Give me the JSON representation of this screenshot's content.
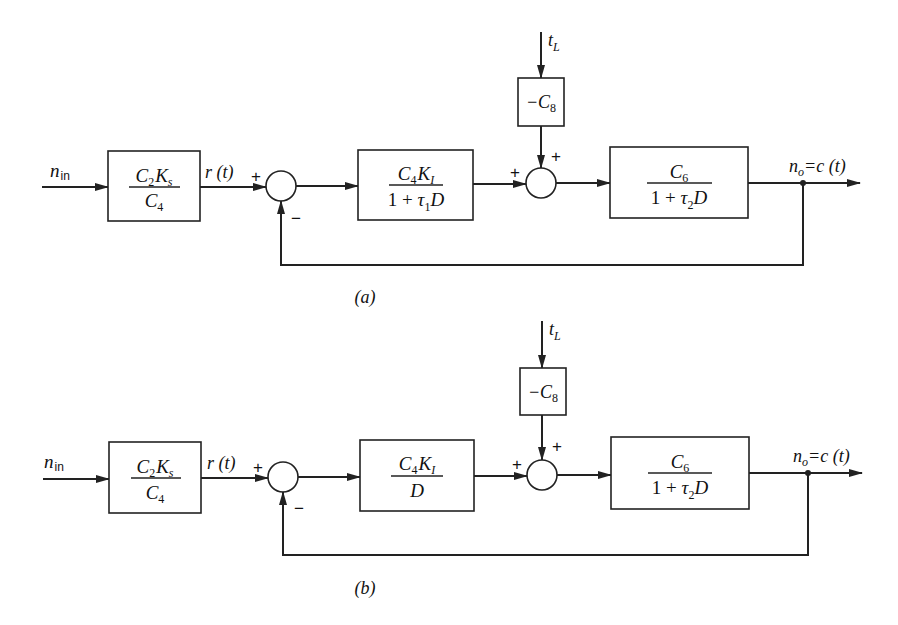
{
  "diagrams": [
    {
      "id": "a",
      "caption": "(a)",
      "input_label": "n",
      "input_sub": "in",
      "reference_label": "r (t)",
      "disturbance_label": "t",
      "disturbance_sub": "L",
      "output_label_n": "n",
      "output_label_sub": "o",
      "output_label_rest": "=c (t)",
      "summer1_signs": {
        "plus": "+",
        "minus": "−"
      },
      "summer2_signs": {
        "left": "+",
        "top": "+"
      },
      "blocks": {
        "b1": {
          "num_a": "C",
          "num_a_sub": "2",
          "num_b": "K",
          "num_b_sub": "s",
          "den": "C",
          "den_sub": "4"
        },
        "b2": {
          "num_a": "C",
          "num_a_sub": "4",
          "num_b": "K",
          "num_b_sub": "I",
          "den_pre": "1 + ",
          "den_tau": "τ",
          "den_tau_sub": "1",
          "den_post": "D"
        },
        "b8": {
          "label": "−C",
          "label_sub": "8"
        },
        "b3": {
          "num": "C",
          "num_sub": "6",
          "den_pre": "1 + ",
          "den_tau": "τ",
          "den_tau_sub": "2",
          "den_post": "D"
        }
      }
    },
    {
      "id": "b",
      "caption": "(b)",
      "input_label": "n",
      "input_sub": "in",
      "reference_label": "r (t)",
      "disturbance_label": "t",
      "disturbance_sub": "L",
      "output_label_n": "n",
      "output_label_sub": "o",
      "output_label_rest": "=c (t)",
      "summer1_signs": {
        "plus": "+",
        "minus": "−"
      },
      "summer2_signs": {
        "left": "+",
        "top": "+"
      },
      "blocks": {
        "b1": {
          "num_a": "C",
          "num_a_sub": "2",
          "num_b": "K",
          "num_b_sub": "s",
          "den": "C",
          "den_sub": "4"
        },
        "b2": {
          "num_a": "C",
          "num_a_sub": "4",
          "num_b": "K",
          "num_b_sub": "I",
          "den": "D"
        },
        "b8": {
          "label": "−C",
          "label_sub": "8"
        },
        "b3": {
          "num": "C",
          "num_sub": "6",
          "den_pre": "1 + ",
          "den_tau": "τ",
          "den_tau_sub": "2",
          "den_post": "D"
        }
      }
    }
  ]
}
